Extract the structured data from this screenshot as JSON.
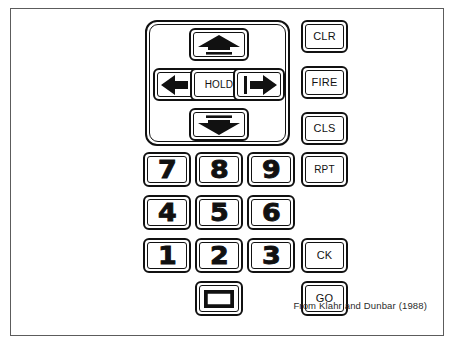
{
  "figure": {
    "cropped_header_text": "…",
    "caption": "From Klahr and Dunbar (1988)",
    "frame_color": "#5c5c5c",
    "key_outline_color": "#111111",
    "background_color": "#ffffff"
  },
  "dpad": {
    "label": "direction-pad",
    "keys": {
      "up": {
        "name": "up-arrow",
        "glyph": "arrow-up-solid"
      },
      "left": {
        "name": "left-arrow",
        "glyph": "arrow-left-solid"
      },
      "hold": {
        "name": "hold",
        "label": "HOLD"
      },
      "right": {
        "name": "right-arrow",
        "glyph": "arrow-right-solid"
      },
      "down": {
        "name": "down-arrow",
        "glyph": "arrow-down-solid"
      }
    }
  },
  "numpad": {
    "rows": [
      [
        {
          "label": "7"
        },
        {
          "label": "8"
        },
        {
          "label": "9"
        }
      ],
      [
        {
          "label": "4"
        },
        {
          "label": "5"
        },
        {
          "label": "6"
        }
      ],
      [
        {
          "label": "1"
        },
        {
          "label": "2"
        },
        {
          "label": "3"
        }
      ]
    ],
    "blank_key": {
      "name": "blank-rectangle-key",
      "glyph": "rectangle-outline"
    }
  },
  "command_column": {
    "keys": [
      {
        "name": "clr",
        "label": "CLR"
      },
      {
        "name": "fire",
        "label": "FIRE"
      },
      {
        "name": "cls",
        "label": "CLS"
      },
      {
        "name": "rpt",
        "label": "RPT"
      },
      {
        "name": "ck",
        "label": "CK"
      },
      {
        "name": "go",
        "label": "GO"
      }
    ]
  }
}
